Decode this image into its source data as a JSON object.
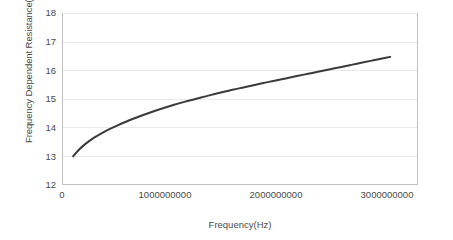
{
  "chart_data": {
    "type": "line",
    "title": "",
    "xlabel": "Frequency(Hz)",
    "ylabel": "Frequency Dependent Resistance(Ohm)",
    "xlim": [
      0,
      3200000000
    ],
    "ylim": [
      12,
      18
    ],
    "grid": "horizontal",
    "legend": "none",
    "line_color": "#3a3a3a",
    "xticks": [
      "0",
      "1000000000",
      "2000000000",
      "3000000000"
    ],
    "xtick_values": [
      0,
      1000000000,
      2000000000,
      3000000000
    ],
    "yticks": [
      "12",
      "13",
      "14",
      "15",
      "16",
      "17",
      "18"
    ],
    "ytick_values": [
      12,
      13,
      14,
      15,
      16,
      17,
      18
    ],
    "series": [
      {
        "name": "Frequency Dependent Resistance",
        "x": [
          100000000,
          150000000,
          200000000,
          250000000,
          300000000,
          400000000,
          500000000,
          600000000,
          700000000,
          800000000,
          900000000,
          1000000000,
          1100000000,
          1200000000,
          1300000000,
          1400000000,
          1500000000,
          1600000000,
          1700000000,
          1800000000,
          1900000000,
          2000000000,
          2100000000,
          2200000000,
          2300000000,
          2400000000,
          2500000000,
          2600000000,
          2700000000,
          2800000000,
          2900000000,
          2950000000
        ],
        "y": [
          13.0,
          13.22,
          13.4,
          13.55,
          13.68,
          13.9,
          14.08,
          14.25,
          14.4,
          14.54,
          14.67,
          14.79,
          14.9,
          15.0,
          15.1,
          15.2,
          15.29,
          15.38,
          15.46,
          15.55,
          15.63,
          15.71,
          15.79,
          15.87,
          15.95,
          16.03,
          16.11,
          16.19,
          16.27,
          16.35,
          16.43,
          16.47
        ]
      }
    ]
  },
  "axes": {
    "y_tick_labels": [
      "18",
      "17",
      "16",
      "15",
      "14",
      "13",
      "12"
    ],
    "x_tick_labels": [
      "0",
      "1000000000",
      "2000000000",
      "3000000000"
    ],
    "y_axis_title": "Frequency Dependent Resistance(Ohm)",
    "x_axis_title": "Frequency(Hz)"
  },
  "colors": {
    "line": "#3a3a3a",
    "grid": "#e9e9ec",
    "axis": "#c8c8cc",
    "text": "#4a4a4a",
    "background": "#ffffff"
  }
}
